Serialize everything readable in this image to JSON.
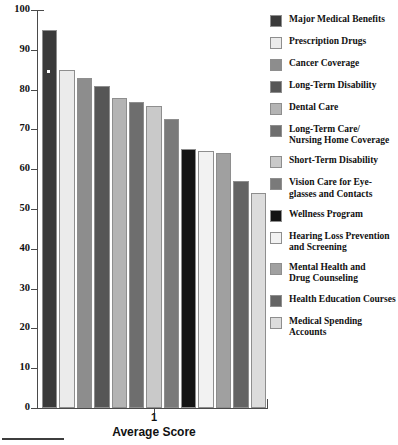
{
  "chart_data": {
    "type": "bar",
    "title": "",
    "subtitle": "",
    "xlabel": "Average Score",
    "ylabel": "",
    "ylim": [
      0,
      100
    ],
    "ytick_labels": [
      "100",
      "90",
      "80",
      "70",
      "60",
      "50",
      "40",
      "30",
      "20",
      "10",
      "0"
    ],
    "ytick_values": [
      100,
      90,
      80,
      70,
      60,
      50,
      40,
      30,
      20,
      10,
      0
    ],
    "xtick_labels": [
      "1"
    ],
    "grid": false,
    "legend_position": "right",
    "categories": [
      "Major Medical Benefits",
      "Prescription Drugs",
      "Cancer Coverage",
      "Long-Term Disability",
      "Dental Care",
      "Long-Term Care/\nNursing Home Coverage",
      "Short-Term Disability",
      "Vision Care for Eye-\nglasses and Contacts",
      "Wellness Program",
      "Hearing Loss Prevention\nand Screening",
      "Mental Health and\nDrug Counseling",
      "Health Education Courses",
      "Medical Spending Accounts"
    ],
    "values": [
      95,
      85,
      83,
      81,
      78,
      77,
      76,
      72.5,
      65,
      64.5,
      64,
      57,
      54
    ],
    "colors": [
      "#3a3a3a",
      "#ebebeb",
      "#8d8d8d",
      "#565656",
      "#b4b4b4",
      "#6e6e6e",
      "#c9c9c9",
      "#7a7a7a",
      "#141414",
      "#f2f2f2",
      "#a0a0a0",
      "#646464",
      "#dcdcdc"
    ]
  },
  "legend": {
    "items": [
      {
        "label": "Major Medical Benefits",
        "color": "#3a3a3a"
      },
      {
        "label": "Prescription Drugs",
        "color": "#ebebeb"
      },
      {
        "label": "Cancer Coverage",
        "color": "#8d8d8d"
      },
      {
        "label": "Long-Term Disability",
        "color": "#565656"
      },
      {
        "label": "Dental Care",
        "color": "#b4b4b4"
      },
      {
        "label": "Long-Term Care/\nNursing Home Coverage",
        "color": "#6e6e6e"
      },
      {
        "label": "Short-Term Disability",
        "color": "#c9c9c9"
      },
      {
        "label": "Vision Care for Eye-\nglasses and Contacts",
        "color": "#7a7a7a"
      },
      {
        "label": "Wellness Program",
        "color": "#141414"
      },
      {
        "label": "Hearing Loss Prevention\nand Screening",
        "color": "#f2f2f2"
      },
      {
        "label": "Mental Health and\nDrug Counseling",
        "color": "#a0a0a0"
      },
      {
        "label": "Health Education Courses",
        "color": "#646464"
      },
      {
        "label": "Medical Spending Accounts",
        "color": "#dcdcdc"
      }
    ]
  },
  "axis": {
    "x_tick_label": "1",
    "x_title": "Average Score"
  }
}
